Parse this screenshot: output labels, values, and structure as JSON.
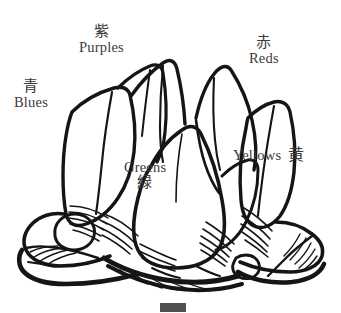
{
  "figure": {
    "background_color": "#ffffff",
    "ink_color": "#151515",
    "label_color": "#3a3a3a"
  },
  "labels": [
    {
      "id": "purples",
      "jp": "紫",
      "en": "Purples",
      "order": "jp-above-en",
      "position": "top-left-center"
    },
    {
      "id": "reds",
      "jp": "赤",
      "en": "Reds",
      "order": "jp-above-en",
      "position": "top-right"
    },
    {
      "id": "blues",
      "jp": "青",
      "en": "Blues",
      "order": "jp-above-en",
      "position": "left"
    },
    {
      "id": "greens",
      "jp": "緑",
      "en": "Greens",
      "order": "en-above-jp",
      "position": "center"
    },
    {
      "id": "yellows",
      "jp": "黄",
      "en": "Yellows",
      "order": "en-then-jp-inline",
      "position": "right"
    }
  ],
  "caption": {
    "visible_fragment": ""
  }
}
